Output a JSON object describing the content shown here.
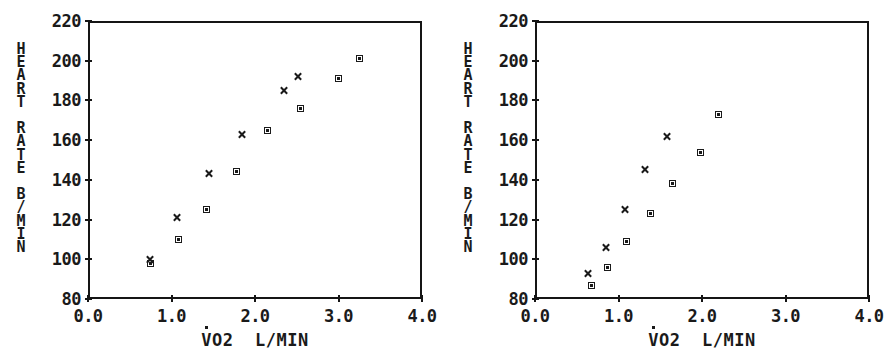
{
  "figure": {
    "panel_count": 2,
    "background": "#ffffff",
    "ink": "#1a1a1a"
  },
  "chart_data": [
    {
      "type": "scatter",
      "title": "20 - 30 Y",
      "xlabel": "V̇O2  L/MIN",
      "ylabel": "HEART RATE B/MIN",
      "xlim": [
        0.0,
        4.0
      ],
      "ylim": [
        80,
        220
      ],
      "xticks": [
        "0.0",
        "1.0",
        "2.0",
        "3.0",
        "4.0"
      ],
      "xtick_values": [
        0.0,
        1.0,
        2.0,
        3.0,
        4.0
      ],
      "yticks": [
        "220",
        "200",
        "180",
        "160",
        "140",
        "120",
        "100",
        "80"
      ],
      "ytick_values": [
        220,
        200,
        180,
        160,
        140,
        120,
        100,
        80
      ],
      "grid": false,
      "legend": "none",
      "series": [
        {
          "name": "square",
          "marker": "filled-square",
          "points": [
            [
              0.75,
              98
            ],
            [
              1.08,
              110
            ],
            [
              1.42,
              125
            ],
            [
              1.78,
              144
            ],
            [
              2.15,
              165
            ],
            [
              2.55,
              176
            ],
            [
              3.0,
              191
            ],
            [
              3.25,
              201
            ]
          ]
        },
        {
          "name": "cross",
          "marker": "x",
          "points": [
            [
              0.74,
              100
            ],
            [
              1.07,
              121
            ],
            [
              1.45,
              143
            ],
            [
              1.85,
              163
            ],
            [
              2.35,
              185
            ],
            [
              2.52,
              192
            ]
          ]
        }
      ]
    },
    {
      "type": "scatter",
      "title": "60 - 70 Y",
      "xlabel": "V̇O2  L/MIN",
      "ylabel": "HEART RATE B/MIN",
      "xlim": [
        0.0,
        4.0
      ],
      "ylim": [
        80,
        220
      ],
      "xticks": [
        "0.0",
        "1.0",
        "2.0",
        "3.0",
        "4.0"
      ],
      "xtick_values": [
        0.0,
        1.0,
        2.0,
        3.0,
        4.0
      ],
      "yticks": [
        "220",
        "200",
        "180",
        "160",
        "140",
        "120",
        "100",
        "80"
      ],
      "ytick_values": [
        220,
        200,
        180,
        160,
        140,
        120,
        100,
        80
      ],
      "grid": false,
      "legend": "none",
      "series": [
        {
          "name": "square",
          "marker": "filled-square",
          "points": [
            [
              0.68,
              87
            ],
            [
              0.87,
              96
            ],
            [
              1.1,
              109
            ],
            [
              1.38,
              123
            ],
            [
              1.65,
              138
            ],
            [
              1.98,
              154
            ],
            [
              2.2,
              173
            ]
          ]
        },
        {
          "name": "cross",
          "marker": "x",
          "points": [
            [
              0.63,
              93
            ],
            [
              0.85,
              106
            ],
            [
              1.08,
              125
            ],
            [
              1.32,
              145
            ],
            [
              1.58,
              162
            ]
          ]
        }
      ]
    }
  ]
}
